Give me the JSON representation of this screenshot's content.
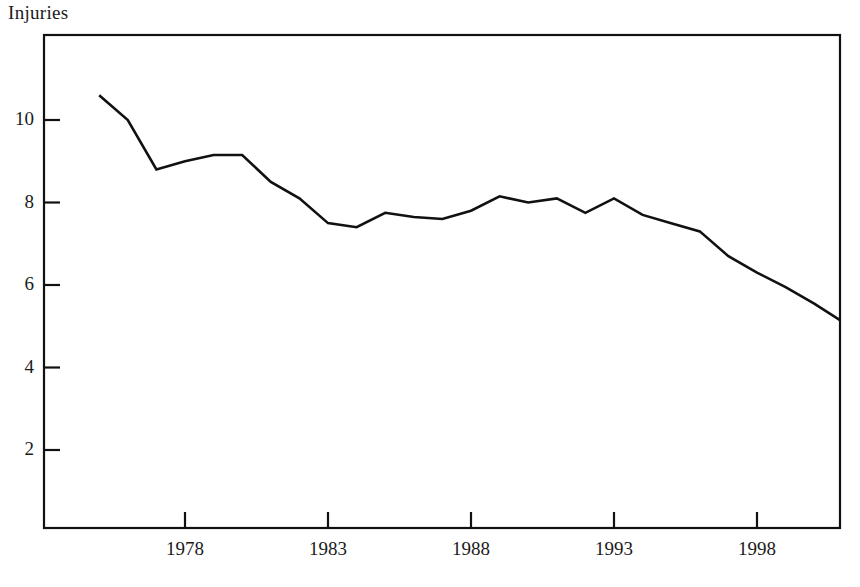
{
  "chart_data": {
    "type": "line",
    "title": "Injuries",
    "xlabel": "",
    "ylabel": "",
    "grid": false,
    "legend": "none",
    "xlim": [
      1975,
      2001
    ],
    "ylim": [
      0,
      11.9
    ],
    "xticks": [
      1978,
      1983,
      1988,
      1993,
      1998
    ],
    "xtick_labels": [
      "1978",
      "1983",
      "1988",
      "1993",
      "1998"
    ],
    "yticks": [
      2,
      4,
      6,
      8,
      10
    ],
    "ytick_labels": [
      "2",
      "4",
      "6",
      "8",
      "10"
    ],
    "series": [
      {
        "name": "Injuries",
        "x": [
          1975,
          1976,
          1977,
          1978,
          1979,
          1980,
          1981,
          1982,
          1983,
          1984,
          1985,
          1986,
          1987,
          1988,
          1989,
          1990,
          1991,
          1992,
          1993,
          1994,
          1995,
          1996,
          1997,
          1998,
          1999,
          2000,
          2001
        ],
        "values": [
          10.6,
          10.0,
          8.8,
          9.0,
          9.15,
          9.15,
          8.5,
          8.1,
          7.5,
          7.4,
          7.75,
          7.65,
          7.6,
          7.8,
          8.15,
          8.0,
          8.1,
          7.75,
          8.1,
          7.7,
          7.5,
          7.3,
          6.7,
          6.3,
          5.95,
          5.55,
          5.15
        ]
      }
    ]
  },
  "axis": {
    "frame_color": "#111111",
    "line_color": "#111111"
  }
}
